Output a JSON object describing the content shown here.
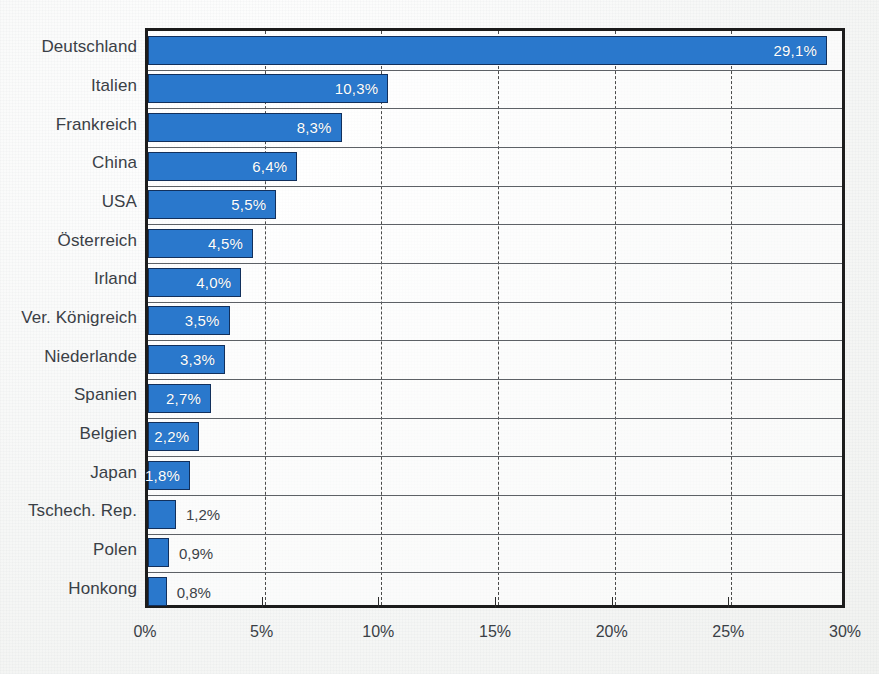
{
  "chart_data": {
    "type": "bar",
    "orientation": "horizontal",
    "title": "",
    "subtitle": "",
    "xlabel": "",
    "ylabel": "",
    "xlim": [
      0,
      30
    ],
    "grid": true,
    "legend": null,
    "value_suffix": "%",
    "decimal_separator": ",",
    "categories": [
      "Deutschland",
      "Italien",
      "Frankreich",
      "China",
      "USA",
      "Österreich",
      "Irland",
      "Ver. Königreich",
      "Niederlande",
      "Spanien",
      "Belgien",
      "Japan",
      "Tschech. Rep.",
      "Polen",
      "Honkong"
    ],
    "values": [
      29.1,
      10.3,
      8.3,
      6.4,
      5.5,
      4.5,
      4.0,
      3.5,
      3.3,
      2.7,
      2.2,
      1.8,
      1.2,
      0.9,
      0.8
    ],
    "value_labels": [
      "29,1%",
      "10,3%",
      "8,3%",
      "6,4%",
      "5,5%",
      "4,5%",
      "4,0%",
      "3,5%",
      "3,3%",
      "2,7%",
      "2,2%",
      "1,8%",
      "1,2%",
      "0,9%",
      "0,8%"
    ],
    "label_placement": [
      "inside",
      "inside",
      "inside",
      "inside",
      "inside",
      "inside",
      "inside",
      "inside",
      "inside",
      "inside",
      "inside",
      "inside",
      "outside",
      "outside",
      "outside"
    ],
    "xticks": [
      0,
      5,
      10,
      15,
      20,
      25,
      30
    ],
    "xtick_labels": [
      "0%",
      "5%",
      "10%",
      "15%",
      "20%",
      "25%",
      "30%"
    ],
    "gridline_values": [
      5,
      10,
      15,
      20,
      25
    ],
    "colors": {
      "bar_fill": "#2a78cc",
      "bar_stroke": "#12305c",
      "value_label_inside": "#ffffff",
      "value_label_outside": "#3c4248",
      "category_label": "#3a4046",
      "axis_line": "#1c1c1c",
      "gridline": "#4a4a4a",
      "row_separator": "#5d6166",
      "background": "#fbfbfa"
    }
  }
}
